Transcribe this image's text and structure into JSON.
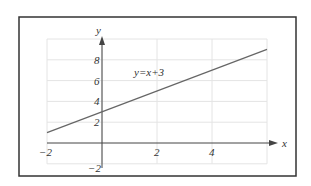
{
  "chart_data": {
    "type": "line",
    "title": "",
    "xlabel": "x",
    "ylabel": "y",
    "xlim": [
      -2,
      6
    ],
    "ylim": [
      -2,
      10
    ],
    "grid": true,
    "x_ticks": [
      -2,
      2,
      4
    ],
    "x_tick_labels": [
      "−2",
      "2",
      "4"
    ],
    "y_ticks": [
      8,
      6,
      4,
      2,
      -2
    ],
    "y_tick_labels": [
      "8",
      "6",
      "4",
      "2",
      "−2"
    ],
    "series": [
      {
        "name": "y=x+3",
        "x": [
          -2,
          6
        ],
        "y": [
          1,
          9
        ]
      }
    ],
    "annotations": [
      {
        "text": "y=x+3",
        "x": 1,
        "y": 6.5
      }
    ]
  },
  "colors": {
    "line": "#666666",
    "grid": "#e4e4e4",
    "axis": "#444444",
    "frame": "#333333"
  }
}
